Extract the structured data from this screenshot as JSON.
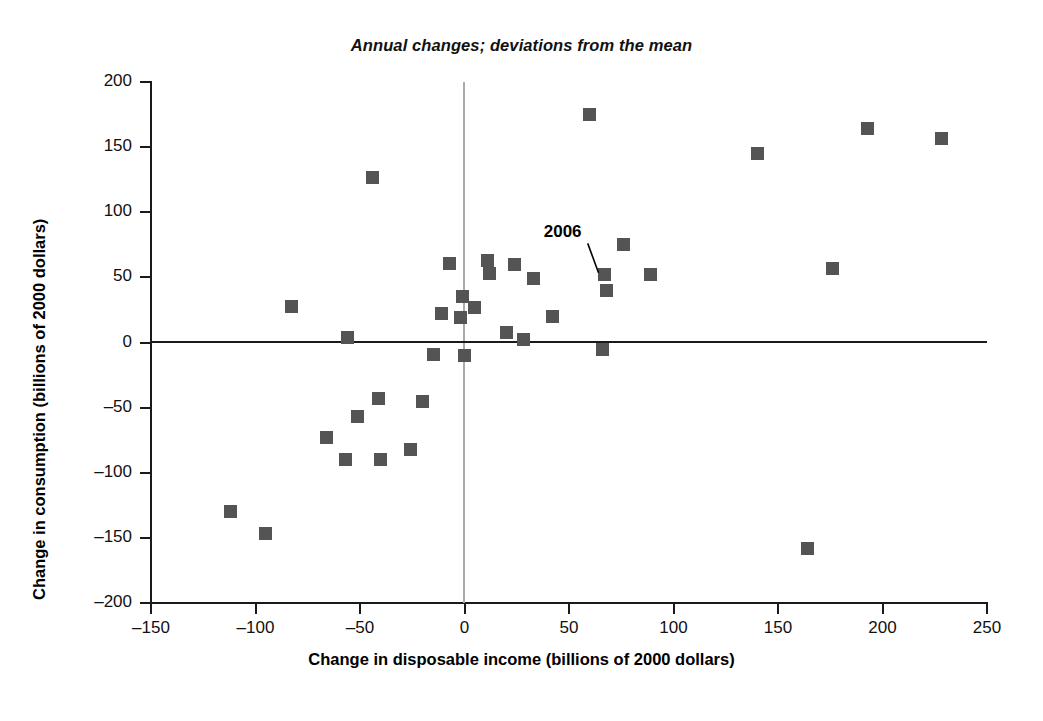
{
  "chart_data": {
    "type": "scatter",
    "title": "Annual changes; deviations from the mean",
    "xlabel": "Change in disposable income (billions of 2000 dollars)",
    "ylabel": "Change in consumption (billions of 2000 dollars)",
    "xlim": [
      -150,
      250
    ],
    "ylim": [
      -200,
      200
    ],
    "xticks": [
      -150,
      -100,
      -50,
      0,
      50,
      100,
      150,
      200,
      250
    ],
    "xtick_labels": [
      "–150",
      "–100",
      "–50",
      "0",
      "50",
      "100",
      "150",
      "200",
      "250"
    ],
    "yticks": [
      200,
      150,
      100,
      50,
      0,
      -50,
      -100,
      -150,
      -200
    ],
    "ytick_labels": [
      "200",
      "150",
      "100",
      "50",
      "0",
      "–50",
      "–100",
      "–150",
      "–200"
    ],
    "grid": false,
    "legend": null,
    "marker_color": "#545454",
    "marker_shape": "square",
    "reference_lines": [
      {
        "name": "zero-horizontal-line",
        "axis": "y",
        "value": 0,
        "color": "#1a1a1a"
      },
      {
        "name": "zero-vertical-line",
        "axis": "x",
        "value": 0,
        "color": "#aaaaaa"
      }
    ],
    "annotations": [
      {
        "label": "2006",
        "point_x": 67,
        "point_y": 52,
        "text_x": 58,
        "text_y": 83
      }
    ],
    "points": [
      {
        "x": -112,
        "y": -130
      },
      {
        "x": -95,
        "y": -147
      },
      {
        "x": -83,
        "y": 28
      },
      {
        "x": -66,
        "y": -73
      },
      {
        "x": -57,
        "y": -90
      },
      {
        "x": -56,
        "y": 4
      },
      {
        "x": -51,
        "y": -57
      },
      {
        "x": -44,
        "y": 127
      },
      {
        "x": -41,
        "y": -43
      },
      {
        "x": -40,
        "y": -90
      },
      {
        "x": -26,
        "y": -82
      },
      {
        "x": -20,
        "y": -45
      },
      {
        "x": -15,
        "y": -9
      },
      {
        "x": -11,
        "y": 22
      },
      {
        "x": -7,
        "y": 61
      },
      {
        "x": -2,
        "y": 19
      },
      {
        "x": -1,
        "y": 35
      },
      {
        "x": 0,
        "y": -10
      },
      {
        "x": 5,
        "y": 27
      },
      {
        "x": 11,
        "y": 63
      },
      {
        "x": 12,
        "y": 53
      },
      {
        "x": 20,
        "y": 8
      },
      {
        "x": 24,
        "y": 60
      },
      {
        "x": 28,
        "y": 2
      },
      {
        "x": 33,
        "y": 49
      },
      {
        "x": 42,
        "y": 20
      },
      {
        "x": 60,
        "y": 175
      },
      {
        "x": 66,
        "y": -5
      },
      {
        "x": 67,
        "y": 52
      },
      {
        "x": 68,
        "y": 40
      },
      {
        "x": 76,
        "y": 75
      },
      {
        "x": 89,
        "y": 52
      },
      {
        "x": 140,
        "y": 145
      },
      {
        "x": 164,
        "y": -158
      },
      {
        "x": 176,
        "y": 57
      },
      {
        "x": 193,
        "y": 164
      },
      {
        "x": 228,
        "y": 157
      }
    ]
  }
}
